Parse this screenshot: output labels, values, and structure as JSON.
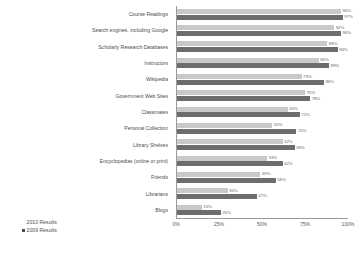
{
  "chart_data": {
    "type": "bar",
    "orientation": "horizontal",
    "title": "",
    "xlabel": "",
    "ylabel": "",
    "xlim": [
      0,
      100
    ],
    "grid": false,
    "legend_position": "bottom-left",
    "categories": [
      "Course Readings",
      "Search engines, including Google",
      "Scholarly Research Databases",
      "Instructors",
      "Wikipedia",
      "Government Web Sites",
      "Classmates",
      "Personal Collection",
      "Library Shelves",
      "Encyclopedias (online or print)",
      "Friends",
      "Librarians",
      "Blogs"
    ],
    "series": [
      {
        "name": "2010 Results",
        "color": "#c9c9c9",
        "values": [
          96,
          92,
          88,
          83,
          73,
          75,
          65,
          56,
          62,
          53,
          49,
          30,
          15
        ],
        "labels": [
          "96%",
          "92%",
          "88%",
          "83%",
          "73%",
          "75%",
          "65%",
          "56%",
          "62%",
          "53%",
          "49%",
          "30%",
          "15%"
        ]
      },
      {
        "name": "2009 Results",
        "color": "#6d6d6d",
        "values": [
          97,
          96,
          94,
          89,
          86,
          78,
          72,
          70,
          69,
          62,
          58,
          47,
          26
        ],
        "labels": [
          "97%",
          "96%",
          "94%",
          "89%",
          "86%",
          "78%",
          "72%",
          "70%",
          "69%",
          "62%",
          "58%",
          "47%",
          "26%"
        ]
      }
    ],
    "xticks": [
      0,
      25,
      50,
      75,
      100
    ],
    "xtick_labels": [
      "0%",
      "25%",
      "50%",
      "75%",
      "100%"
    ]
  },
  "legend": {
    "items": [
      {
        "label": "2010 Results",
        "color": "#c9c9c9",
        "swatch_visible": false
      },
      {
        "label": "2009 Results",
        "color": "#4d4d4d",
        "swatch_visible": true
      }
    ]
  }
}
